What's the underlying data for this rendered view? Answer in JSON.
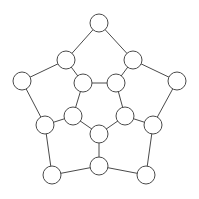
{
  "diagram": {
    "type": "graph",
    "style": {
      "background": "#ffffff",
      "edge_color": "#4a4a4a",
      "node_fill": "#ffffff",
      "node_stroke": "#4a4a4a",
      "node_radius": 9
    },
    "nodes": [
      {
        "id": "A",
        "x": 99,
        "y": 23
      },
      {
        "id": "B",
        "x": 66,
        "y": 60
      },
      {
        "id": "C",
        "x": 133,
        "y": 60
      },
      {
        "id": "D",
        "x": 22,
        "y": 81
      },
      {
        "id": "E",
        "x": 177,
        "y": 81
      },
      {
        "id": "F",
        "x": 83,
        "y": 83
      },
      {
        "id": "G",
        "x": 116,
        "y": 83
      },
      {
        "id": "H",
        "x": 45,
        "y": 125
      },
      {
        "id": "I",
        "x": 73,
        "y": 116
      },
      {
        "id": "J",
        "x": 125,
        "y": 116
      },
      {
        "id": "K",
        "x": 153,
        "y": 125
      },
      {
        "id": "L",
        "x": 99,
        "y": 134
      },
      {
        "id": "M",
        "x": 52,
        "y": 175
      },
      {
        "id": "N",
        "x": 99,
        "y": 166
      },
      {
        "id": "O",
        "x": 146,
        "y": 175
      }
    ],
    "edges": [
      [
        "A",
        "B"
      ],
      [
        "A",
        "C"
      ],
      [
        "B",
        "D"
      ],
      [
        "C",
        "E"
      ],
      [
        "B",
        "F"
      ],
      [
        "C",
        "G"
      ],
      [
        "F",
        "G"
      ],
      [
        "F",
        "I"
      ],
      [
        "G",
        "J"
      ],
      [
        "I",
        "L"
      ],
      [
        "J",
        "L"
      ],
      [
        "D",
        "H"
      ],
      [
        "E",
        "K"
      ],
      [
        "H",
        "I"
      ],
      [
        "J",
        "K"
      ],
      [
        "H",
        "M"
      ],
      [
        "K",
        "O"
      ],
      [
        "L",
        "N"
      ],
      [
        "M",
        "N"
      ],
      [
        "N",
        "O"
      ]
    ]
  }
}
